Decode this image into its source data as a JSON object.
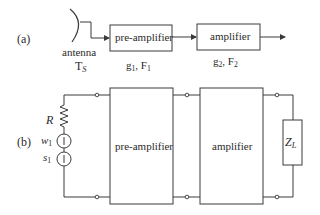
{
  "figure": {
    "part_a": {
      "label": "(a)",
      "antenna": {
        "label": "antenna",
        "temp_symbol": "T",
        "temp_sub": "S"
      },
      "preamp": {
        "label": "pre-amplifier",
        "gain_symbol": "g",
        "gain_sub": "1",
        "noise_symbol": "F",
        "noise_sub": "1"
      },
      "amp": {
        "label": "amplifier",
        "gain_symbol": "g",
        "gain_sub": "2",
        "noise_symbol": "F",
        "noise_sub": "2"
      }
    },
    "part_b": {
      "label": "(b)",
      "resistor": {
        "label": "R"
      },
      "noise_source": {
        "symbol": "w",
        "sub": "1"
      },
      "signal_source": {
        "symbol": "s",
        "sub": "1"
      },
      "preamp": {
        "label": "pre-amplifier"
      },
      "amp": {
        "label": "amplifier"
      },
      "load": {
        "symbol": "Z",
        "sub": "L"
      }
    },
    "colors": {
      "line": "#3a3a3a",
      "text": "#2a2a2a",
      "background": "#ffffff"
    }
  }
}
